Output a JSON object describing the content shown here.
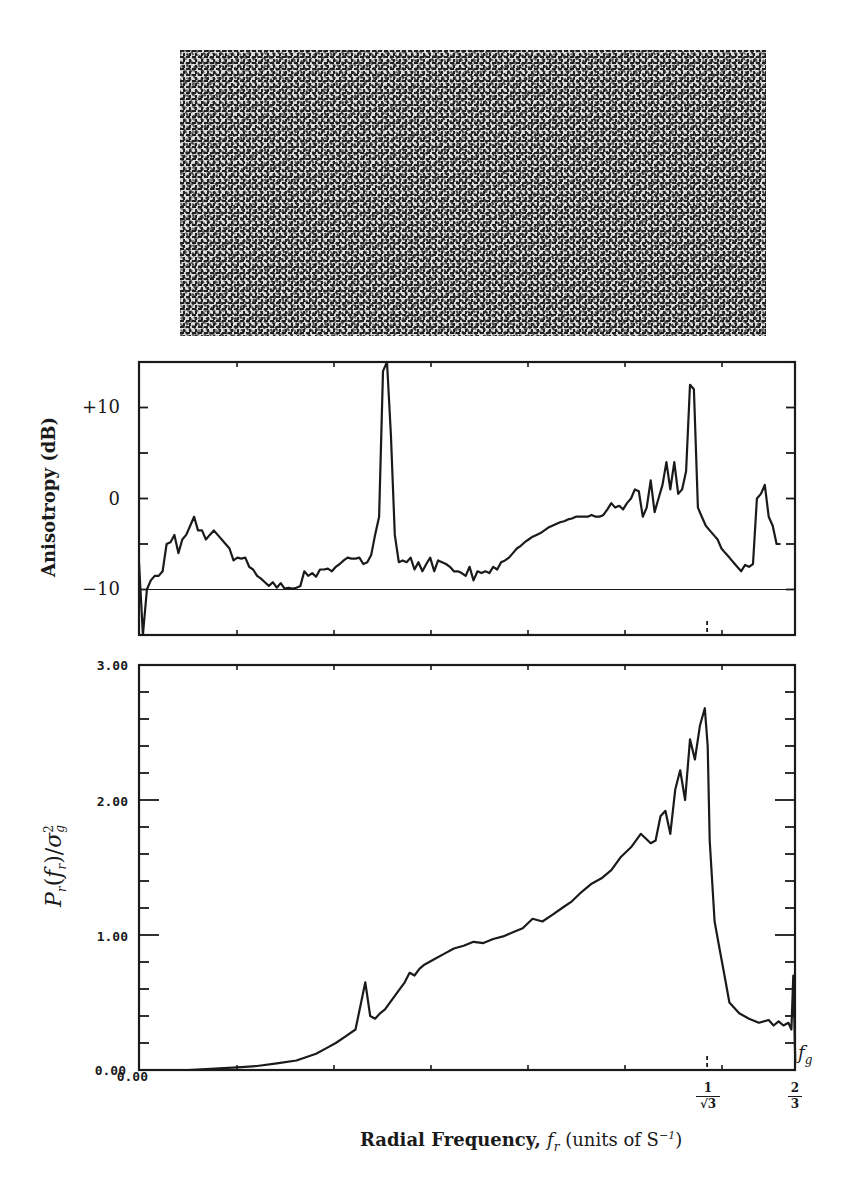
{
  "figure": {
    "texture_caption": "",
    "top_panel": {
      "ylabel": "Anisotropy (dB)",
      "yticks": [
        "+10",
        "0",
        "−10"
      ]
    },
    "bottom_panel": {
      "ylabel_html": "P_r(f_r)/σ_g^2",
      "ylabel_parts": {
        "P": "P",
        "r": "r",
        "f": "f",
        "fr": "r",
        "sigma": "σ",
        "sub": "g",
        "sup": "2"
      },
      "yticks": [
        "3.00",
        "2.00",
        "1.00",
        "0.00"
      ],
      "x_origin_label": "0.00",
      "marker_fg": "f",
      "marker_fg_sub": "g"
    },
    "xaxis": {
      "title_bold": "Radial Frequency, ",
      "title_var": "f",
      "title_var_sub": "r",
      "title_units": " (units of S",
      "title_units_sup": "−1",
      "title_close": ")",
      "tick_1_num": "1",
      "tick_1_den": "√3",
      "tick_2_num": "2",
      "tick_2_den": "3"
    }
  },
  "chart_data": [
    {
      "type": "line",
      "title": "",
      "xlabel": "Radial Frequency, f_r (units of S^-1)",
      "ylabel": "Anisotropy (dB)",
      "ylim": [
        -15,
        15
      ],
      "xlim": [
        0,
        0.6667
      ],
      "reference_line": -10,
      "grid": false,
      "x": [
        0.0,
        0.004,
        0.008,
        0.012,
        0.016,
        0.02,
        0.024,
        0.028,
        0.032,
        0.036,
        0.04,
        0.044,
        0.048,
        0.052,
        0.056,
        0.06,
        0.064,
        0.068,
        0.072,
        0.076,
        0.08,
        0.084,
        0.088,
        0.092,
        0.096,
        0.1,
        0.104,
        0.108,
        0.112,
        0.116,
        0.12,
        0.124,
        0.128,
        0.132,
        0.136,
        0.14,
        0.144,
        0.148,
        0.152,
        0.156,
        0.16,
        0.164,
        0.168,
        0.172,
        0.176,
        0.18,
        0.184,
        0.188,
        0.192,
        0.196,
        0.2,
        0.204,
        0.208,
        0.212,
        0.216,
        0.22,
        0.224,
        0.228,
        0.232,
        0.236,
        0.24,
        0.244,
        0.248,
        0.252,
        0.256,
        0.26,
        0.264,
        0.268,
        0.272,
        0.276,
        0.28,
        0.284,
        0.288,
        0.292,
        0.296,
        0.3,
        0.304,
        0.308,
        0.312,
        0.316,
        0.32,
        0.324,
        0.328,
        0.332,
        0.336,
        0.34,
        0.344,
        0.348,
        0.352,
        0.356,
        0.36,
        0.364,
        0.368,
        0.372,
        0.376,
        0.38,
        0.384,
        0.388,
        0.392,
        0.396,
        0.4,
        0.404,
        0.408,
        0.412,
        0.416,
        0.42,
        0.424,
        0.428,
        0.432,
        0.436,
        0.44,
        0.444,
        0.448,
        0.452,
        0.456,
        0.46,
        0.464,
        0.468,
        0.472,
        0.476,
        0.48,
        0.484,
        0.488,
        0.492,
        0.496,
        0.5,
        0.504,
        0.508,
        0.512,
        0.516,
        0.52,
        0.524,
        0.528,
        0.532,
        0.536,
        0.54,
        0.544,
        0.548,
        0.552,
        0.556,
        0.56,
        0.564,
        0.568,
        0.572,
        0.576,
        0.58,
        0.584,
        0.588,
        0.592,
        0.596,
        0.6,
        0.604,
        0.608,
        0.612,
        0.616,
        0.62,
        0.624,
        0.628,
        0.632,
        0.636,
        0.64,
        0.644,
        0.648,
        0.652,
        0.656,
        0.66,
        0.664,
        0.667
      ],
      "y": [
        -7,
        -15,
        -10,
        -9,
        -8.5,
        -8.5,
        -8,
        -5,
        -4.8,
        -4,
        -6,
        -4.5,
        -4,
        -3,
        -2,
        -3.5,
        -3.5,
        -4.5,
        -4,
        -3.5,
        -4,
        -4.5,
        -5,
        -5.5,
        -6.8,
        -6.5,
        -6.6,
        -6.5,
        -7.5,
        -7.8,
        -8.5,
        -8.8,
        -9.2,
        -9.6,
        -9.2,
        -9.8,
        -9.3,
        -9.9,
        -9.8,
        -9.9,
        -9.8,
        -9.6,
        -8,
        -8.5,
        -8.2,
        -8.6,
        -7.8,
        -7.8,
        -7.7,
        -8,
        -7.5,
        -7.2,
        -6.8,
        -6.5,
        -6.6,
        -6.6,
        -6.5,
        -7.2,
        -7,
        -6.2,
        -4,
        -2,
        14,
        15,
        7,
        -4,
        -7,
        -6.8,
        -7,
        -6.5,
        -7.8,
        -7,
        -8,
        -7.2,
        -6.5,
        -8,
        -6.8,
        -7,
        -7.2,
        -7.5,
        -8,
        -8,
        -8.2,
        -8.5,
        -7.5,
        -9,
        -8,
        -8.2,
        -8,
        -8.2,
        -7.5,
        -7.8,
        -7,
        -6.8,
        -6.5,
        -6,
        -5.5,
        -5.2,
        -4.8,
        -4.5,
        -4.2,
        -4,
        -3.8,
        -3.5,
        -3.2,
        -3,
        -2.8,
        -2.6,
        -2.5,
        -2.3,
        -2.2,
        -2,
        -2,
        -2,
        -2,
        -1.8,
        -2,
        -2,
        -1.8,
        -1.2,
        -0.5,
        -1,
        -0.8,
        -1.2,
        -0.5,
        0,
        1,
        0.8,
        -2,
        -1,
        2,
        -1.5,
        0,
        1.5,
        4,
        1,
        4,
        0.5,
        1,
        3,
        12.5,
        12,
        -1,
        -2,
        -3,
        -3.5,
        -4,
        -4.5,
        -5.5,
        -6,
        -6.5,
        -7,
        -7.5,
        -8,
        -7.3,
        -7.5,
        -7.2,
        0,
        0.5,
        1.5,
        -2,
        -3,
        -5,
        -5
      ]
    },
    {
      "type": "line",
      "title": "",
      "xlabel": "Radial Frequency, f_r (units of S^-1)",
      "ylabel": "P_r(f_r)/sigma_g^2",
      "ylim": [
        0,
        3
      ],
      "xlim": [
        0,
        0.6667
      ],
      "yticks": [
        0,
        1,
        2,
        3
      ],
      "grid": false,
      "x_marked": {
        "1/sqrt(3)": 0.5774,
        "2/3": 0.6667,
        "f_g": 0.6667
      },
      "x": [
        0.0,
        0.05,
        0.1,
        0.12,
        0.14,
        0.16,
        0.18,
        0.19,
        0.2,
        0.21,
        0.22,
        0.23,
        0.235,
        0.24,
        0.245,
        0.25,
        0.26,
        0.27,
        0.275,
        0.28,
        0.285,
        0.29,
        0.3,
        0.31,
        0.32,
        0.33,
        0.34,
        0.35,
        0.36,
        0.37,
        0.38,
        0.39,
        0.4,
        0.41,
        0.42,
        0.43,
        0.44,
        0.45,
        0.46,
        0.47,
        0.48,
        0.49,
        0.5,
        0.51,
        0.52,
        0.525,
        0.53,
        0.535,
        0.54,
        0.545,
        0.55,
        0.555,
        0.56,
        0.565,
        0.57,
        0.575,
        0.578,
        0.58,
        0.585,
        0.59,
        0.595,
        0.6,
        0.61,
        0.62,
        0.63,
        0.64,
        0.645,
        0.65,
        0.655,
        0.66,
        0.663,
        0.665,
        0.667
      ],
      "y": [
        0.0,
        0.0,
        0.02,
        0.03,
        0.05,
        0.07,
        0.12,
        0.16,
        0.2,
        0.25,
        0.3,
        0.65,
        0.4,
        0.38,
        0.42,
        0.45,
        0.55,
        0.65,
        0.72,
        0.7,
        0.75,
        0.78,
        0.82,
        0.86,
        0.9,
        0.92,
        0.95,
        0.94,
        0.97,
        0.99,
        1.02,
        1.05,
        1.12,
        1.1,
        1.15,
        1.2,
        1.25,
        1.32,
        1.38,
        1.42,
        1.48,
        1.58,
        1.65,
        1.75,
        1.68,
        1.7,
        1.88,
        1.92,
        1.75,
        2.08,
        2.22,
        2.0,
        2.45,
        2.3,
        2.55,
        2.68,
        2.4,
        1.7,
        1.1,
        0.9,
        0.7,
        0.5,
        0.42,
        0.38,
        0.35,
        0.37,
        0.33,
        0.36,
        0.33,
        0.35,
        0.3,
        0.7,
        0.05
      ]
    }
  ]
}
